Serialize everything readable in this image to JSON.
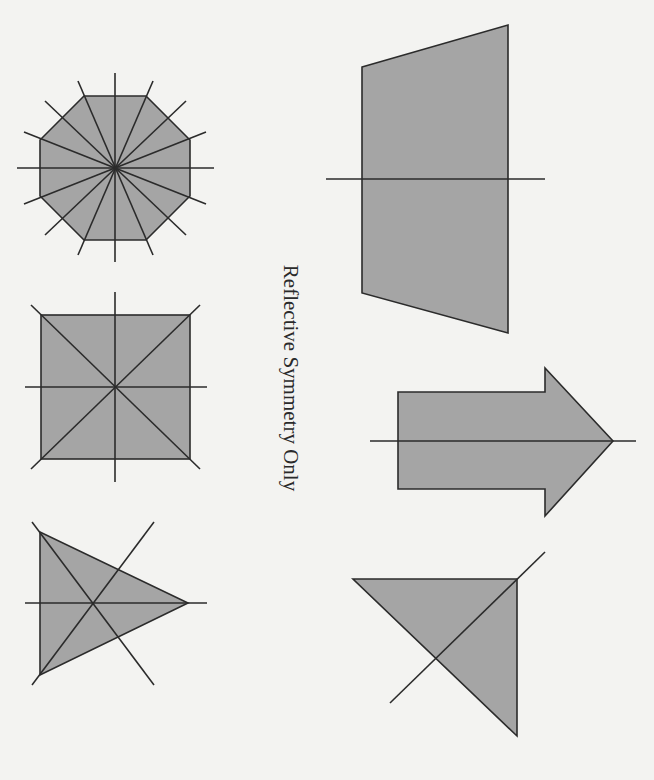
{
  "caption": "Reflective Symmetry Only",
  "colors": {
    "background": "#f3f3f1",
    "fill": "#a5a5a5",
    "stroke": "#2b2b2b"
  },
  "groups": {
    "rotational_and_reflective": [
      {
        "shape": "regular-octagon",
        "lines_of_symmetry": 8
      },
      {
        "shape": "square",
        "lines_of_symmetry": 4
      },
      {
        "shape": "equilateral-triangle",
        "lines_of_symmetry": 3
      }
    ],
    "reflective_only": [
      {
        "shape": "isosceles-trapezoid",
        "lines_of_symmetry": 1
      },
      {
        "shape": "arrow",
        "lines_of_symmetry": 1
      },
      {
        "shape": "isosceles-right-triangle",
        "lines_of_symmetry": 1
      }
    ]
  }
}
